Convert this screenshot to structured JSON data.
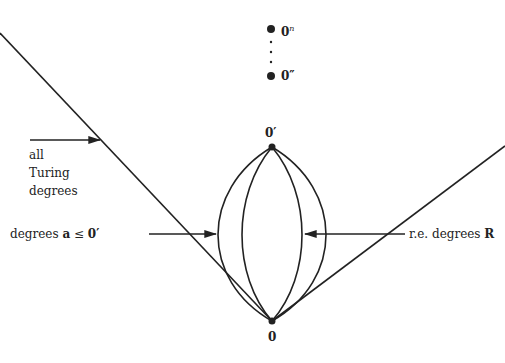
{
  "diagram": {
    "nodes": {
      "zero": {
        "label": "0"
      },
      "zero_jump": {
        "label": "0′"
      },
      "zero_double_jump": {
        "label": "0″"
      },
      "zero_n_jump": {
        "label": "0",
        "superscript": "n"
      }
    },
    "labels": {
      "all_turing": [
        "all",
        "Turing",
        "degrees"
      ],
      "degrees_below": {
        "prefix": "degrees ",
        "var": "a",
        "rel": " ≤ ",
        "bound": "0′"
      },
      "re_degrees": {
        "prefix": "r.e. degrees ",
        "set": "R"
      }
    },
    "colors": {
      "line": "#222222",
      "background": "#ffffff"
    }
  }
}
